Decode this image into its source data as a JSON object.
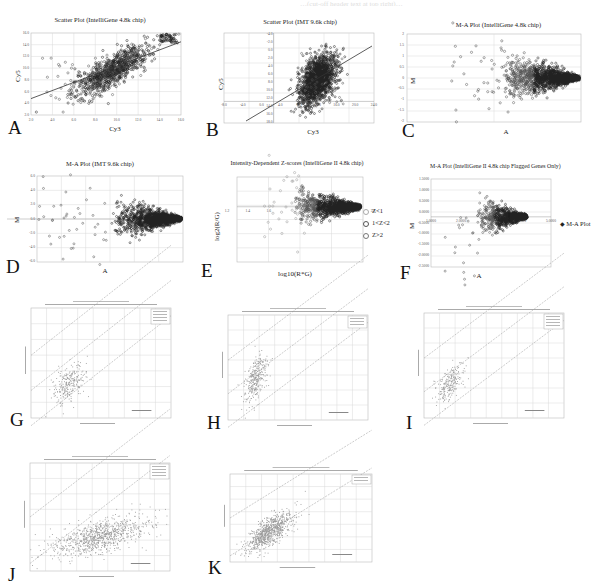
{
  "figure": {
    "header_fragment": "…(cut-off header text at top right)…",
    "panels": [
      {
        "id": "A",
        "letter": "A",
        "title": "Scatter Plot (IntelliGene 4.8k chip)",
        "xlabel": "Cy3",
        "ylabel": "Cy5",
        "legend": []
      },
      {
        "id": "B",
        "letter": "B",
        "title": "Scatter Plot (IMT 9.6k chip)",
        "xlabel": "Cy3",
        "ylabel": "Cy5",
        "legend": []
      },
      {
        "id": "C",
        "letter": "C",
        "title": "M-A Plot (IntelliGene 4.8k chip)",
        "xlabel": "A",
        "ylabel": "M",
        "legend": []
      },
      {
        "id": "D",
        "letter": "D",
        "title": "M-A Plot (IMT 9.6k chip)",
        "xlabel": "A",
        "ylabel": "M",
        "legend": []
      },
      {
        "id": "E",
        "letter": "E",
        "title": "Intensity-Dependent Z-scores (IntelliGene II 4.8k chip)",
        "xlabel": "log10(R*G)",
        "ylabel": "log2(R/G)",
        "legend": [
          "Z<1",
          "1<Z<2",
          "Z>2"
        ]
      },
      {
        "id": "F",
        "letter": "F",
        "title": "M-A Plot (IntelliGene II 4.8k chip Flagged Genes Only)",
        "xlabel": "A",
        "ylabel": "M",
        "legend": [
          "M-A Plot"
        ]
      },
      {
        "id": "G",
        "letter": "G",
        "title": "Channel 1 Compensated Mean vs Channel 2 Compensated Mean",
        "xlabel": "Channel 1 Compensated Mean",
        "ylabel": "Channel 2 Compensated Mean",
        "legend": [
          "Data",
          "Fold Change",
          "Fold Change",
          "Regression"
        ],
        "annotation": "Correlation: 0.0000"
      },
      {
        "id": "H",
        "letter": "H",
        "title": "Channel 1 Compensated Mean vs Channel 2 Compensated Mean",
        "xlabel": "Channel 1 Compensated Mean",
        "ylabel": "Channel 2 Compensated Mean",
        "legend": [
          "Data",
          "Fold Change",
          "Fold Change"
        ],
        "annotation": "Correlation: 0.0000"
      },
      {
        "id": "I",
        "letter": "I",
        "title": "Channel 1 Compensated Mean vs Channel 2 Compensated Mean",
        "xlabel": "Channel 1 Compensated Mean",
        "ylabel": "Channel 2 Compensated Mean",
        "legend": [
          "Data",
          "Fold Change",
          "Fold Change",
          "Regression"
        ],
        "annotation": "Correlation: 0.0000"
      },
      {
        "id": "J",
        "letter": "J",
        "title": "Channel 1 Compensated Mean vs Channel 2 Compensated Mean",
        "xlabel": "Channel 1 Compensated Mean",
        "ylabel": "Channel 2 Compensated Mean",
        "legend": [
          "Data",
          "Fold Change",
          "Fold Change",
          "Regression"
        ],
        "annotation": "Correlation: 0.0000"
      },
      {
        "id": "K",
        "letter": "K",
        "title": "Channel 1 Compensated Mean vs Channel 2 Compensated Mean",
        "xlabel": "Channel 1 Compensated Mean",
        "ylabel": "Channel 2 Compensated Mean",
        "legend": [
          "Data",
          "Fold Change"
        ],
        "annotation": "Correlation: 0.0000"
      }
    ]
  },
  "colors": {
    "point": "#555555",
    "dense": "#222222",
    "grid": "#d8d8d8",
    "axis": "#888888",
    "line": "#333333",
    "light_point": "#9a9a9a"
  },
  "chart_data": [
    {
      "panel": "A",
      "type": "scatter",
      "title": "Scatter Plot (IntelliGene 4.8k chip)",
      "xlabel": "Cy3",
      "ylabel": "Cy5",
      "xlim": [
        2,
        16
      ],
      "ylim": [
        2,
        16
      ],
      "xticks": [
        "2.0",
        "4.0",
        "6.0",
        "8.0",
        "10.0",
        "12.0",
        "14.0",
        "16.0"
      ],
      "yticks": [
        "2.0",
        "4.0",
        "6.0",
        "8.0",
        "10.0",
        "12.0",
        "14.0",
        "16.0"
      ],
      "regression_line": {
        "x": [
          2,
          16
        ],
        "y": [
          4.8,
          14.5
        ]
      },
      "description": "Dense cloud centered near (10,10), spreading to (15.5,15.5); outliers at low Cy3"
    },
    {
      "panel": "B",
      "type": "scatter",
      "title": "Scatter Plot (IMT 9.6k chip)",
      "xlabel": "Cy3",
      "ylabel": "Cy5",
      "xlim": [
        -6,
        14
      ],
      "ylim": [
        -4,
        18
      ],
      "xticks": [
        "-8.0",
        "-4.0",
        "0.0",
        "4.0",
        "8.0",
        "12.0",
        "16.0",
        "20.0",
        "24.0"
      ],
      "yticks": [
        "-4.0",
        "-2.0",
        "0.0",
        "2.0",
        "4.0",
        "6.0",
        "8.0",
        "10.0",
        "12.0",
        "14.0",
        "16.0",
        "18.0"
      ],
      "regression_line": {
        "x": [
          -2,
          24
        ],
        "y": [
          -1,
          16
        ]
      },
      "description": "Very dense cloud centered near (8,8)"
    },
    {
      "panel": "C",
      "type": "scatter",
      "title": "M-A Plot (IntelliGene 4.8k chip)",
      "xlabel": "A",
      "ylabel": "M",
      "xlim": [
        1,
        8
      ],
      "ylim": [
        -2,
        2
      ],
      "yticks": [
        "-2",
        "-1.5",
        "-1",
        "-0.5",
        "0",
        "0.5",
        "1",
        "1.5",
        "2"
      ],
      "description": "Funnel shaped: spread narrows as A increases, centered on M=0"
    },
    {
      "panel": "D",
      "type": "scatter",
      "title": "M-A Plot (IMT 9.6k chip)",
      "xlabel": "A",
      "ylabel": "M",
      "xlim": [
        -1,
        8
      ],
      "ylim": [
        -6,
        6
      ],
      "yticks": [
        "-6.0",
        "-4.0",
        "-2.0",
        "0.0",
        "2.0",
        "4.0",
        "6.0"
      ],
      "description": "Funnel shaped, dense at high A"
    },
    {
      "panel": "E",
      "type": "scatter",
      "title": "Intensity-Dependent Z-scores (IntelliGene II 4.8k chip)",
      "xlabel": "log10(R*G)",
      "ylabel": "log2(R/G)",
      "xlim": [
        1.2,
        3.8
      ],
      "ylim": [
        -2,
        1.2
      ],
      "xticks": [
        "1.2",
        "1.4",
        "1.6",
        "",
        "",
        "",
        "3.4",
        "3.8"
      ],
      "series": [
        {
          "name": "Z<1"
        },
        {
          "name": "1<Z<2"
        },
        {
          "name": "Z>2"
        }
      ],
      "legend_position": "right"
    },
    {
      "panel": "F",
      "type": "scatter",
      "title": "M-A Plot (IntelliGene II 4.8k chip Flagged Genes Only)",
      "xlabel": "A",
      "ylabel": "M",
      "xlim": [
        1,
        5
      ],
      "ylim": [
        -2.5,
        1.5
      ],
      "yticks": [
        "-2.5000",
        "-2.0000",
        "-1.5000",
        "-1.0000",
        "-0.5000",
        "0.0000",
        "0.5000",
        "1.0000",
        "1.5000"
      ],
      "xticks": [
        "1.0000",
        "2.0000",
        "",
        "4.0000",
        "5.0000"
      ],
      "series": [
        {
          "name": "M-A Plot"
        }
      ],
      "legend_position": "right"
    },
    {
      "panel": "G",
      "type": "scatter",
      "xlabel": "Channel 1 Compensated Mean",
      "ylabel": "Channel 2 Compensated Mean",
      "grid": true,
      "fold_change_lines": 3,
      "description": "Sparse cluster in lower-left"
    },
    {
      "panel": "H",
      "type": "scatter",
      "xlabel": "Channel 1 Compensated Mean",
      "ylabel": "Channel 2 Compensated Mean",
      "grid": true,
      "fold_change_lines": 3,
      "description": "Elongated cluster along diagonal in lower-left"
    },
    {
      "panel": "I",
      "type": "scatter",
      "xlabel": "Channel 1 Compensated Mean",
      "ylabel": "Channel 2 Compensated Mean",
      "grid": true,
      "fold_change_lines": 3,
      "description": "Small cluster lower-left"
    },
    {
      "panel": "J",
      "type": "scatter",
      "xlabel": "Channel 1 Compensated Mean",
      "ylabel": "Channel 2 Compensated Mean",
      "grid": true,
      "fold_change_lines": 2,
      "description": "Wide horizontal cluster across lower-middle"
    },
    {
      "panel": "K",
      "type": "scatter",
      "xlabel": "Channel 1 Compensated Mean",
      "ylabel": "Channel 2 Compensated Mean",
      "grid": true,
      "fold_change_lines": 2,
      "description": "Dense cluster lower-left"
    }
  ]
}
